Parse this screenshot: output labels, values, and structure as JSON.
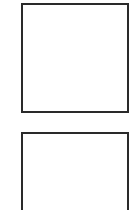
{
  "boxes": [
    {
      "id": "box1",
      "label": ""
    },
    {
      "id": "box2",
      "label": ""
    }
  ],
  "colors": {
    "border": "#2a2a2a",
    "background": "#ffffff"
  }
}
